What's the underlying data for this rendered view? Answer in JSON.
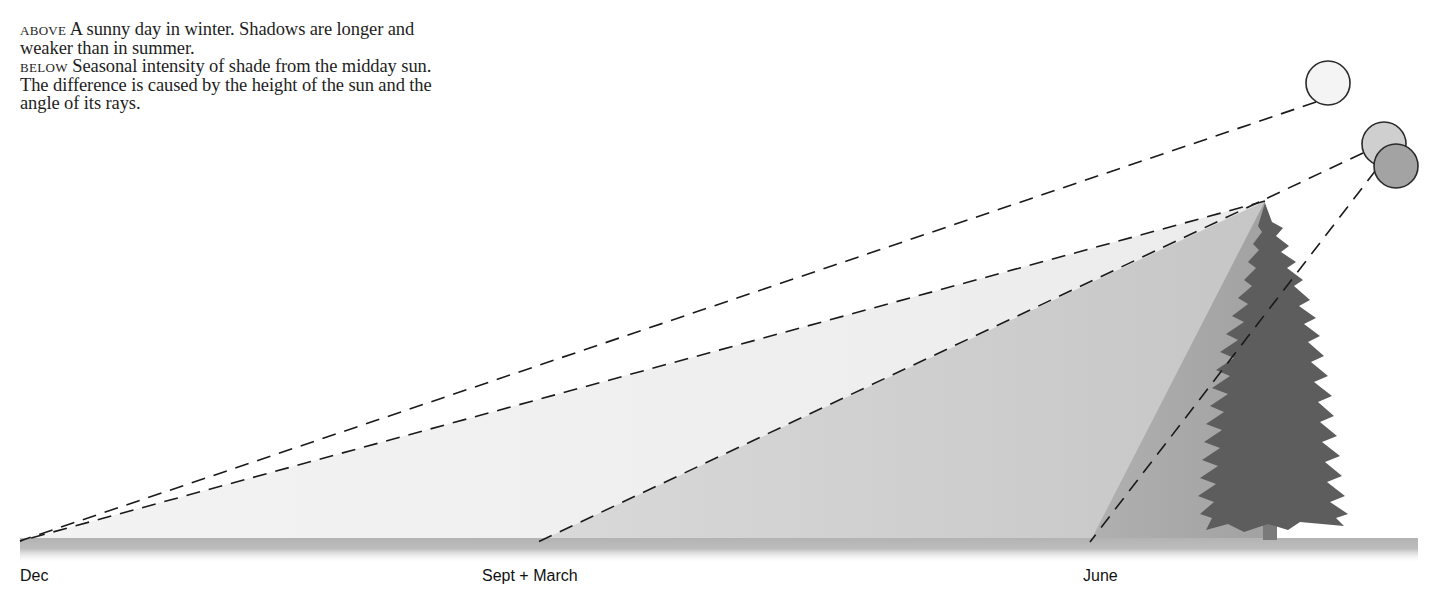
{
  "caption": {
    "above_lead": "ABOVE",
    "above_text": " A sunny day in winter. Shadows are longer and weaker than in summer.",
    "below_lead": "BELOW",
    "below_text": " Seasonal intensity of shade from the midday sun. The difference is caused by the height of the sun and the angle of its rays."
  },
  "labels": {
    "dec": "Dec",
    "sept_march": "Sept + March",
    "june": "June"
  },
  "colors": {
    "background": "#ffffff",
    "dec_shadow": "#efefef",
    "equinox_shadow": "#cdcdcd",
    "june_shadow": "#a9a9a9",
    "tree": "#5e5e5e",
    "ground": "#b9b9b9",
    "sun_winter": "#f4f4f4",
    "sun_equinox": "#cfcfcf",
    "sun_summer": "#a3a3a3",
    "ray_line": "#1a1a1a"
  },
  "diagram": {
    "apex": {
      "x": 1265,
      "y": 201
    },
    "rays": [
      {
        "season": "Dec",
        "ground_x": 20,
        "sun": {
          "cx": 1328,
          "cy": 83,
          "r": 22
        }
      },
      {
        "season": "Sept + March",
        "ground_x": 538,
        "sun": {
          "cx": 1384,
          "cy": 144,
          "r": 22
        }
      },
      {
        "season": "June",
        "ground_x": 1090,
        "sun": {
          "cx": 1396,
          "cy": 166,
          "r": 22
        }
      }
    ],
    "ground": {
      "x_start": 20,
      "x_end": 1418,
      "y": 539,
      "height": 22
    }
  }
}
